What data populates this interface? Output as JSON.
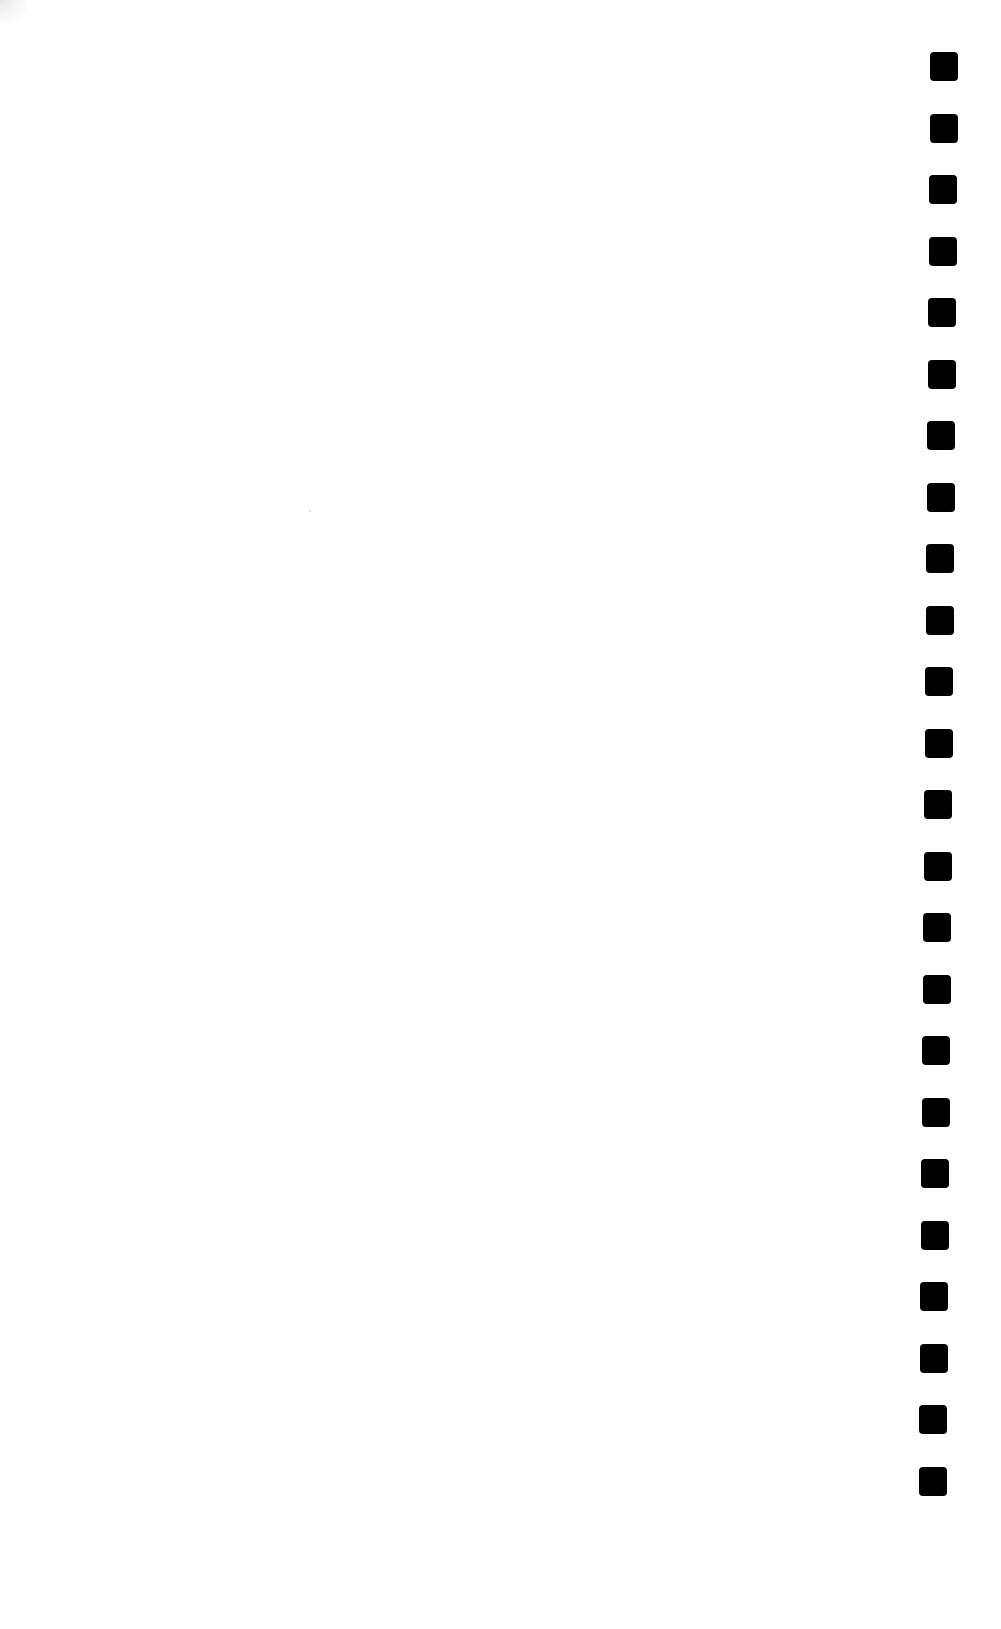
{
  "document": {
    "type": "scanned-blank-page",
    "background_color": "#fefefe",
    "text_content": "",
    "binding_holes": {
      "count": 24,
      "color": "#000000",
      "shape": "rounded-square",
      "size_px": 28,
      "side": "right",
      "positions": [
        {
          "x": 944,
          "y": 66
        },
        {
          "x": 944,
          "y": 128
        },
        {
          "x": 943,
          "y": 189
        },
        {
          "x": 943,
          "y": 251
        },
        {
          "x": 942,
          "y": 312
        },
        {
          "x": 942,
          "y": 374
        },
        {
          "x": 941,
          "y": 435
        },
        {
          "x": 941,
          "y": 497
        },
        {
          "x": 940,
          "y": 558
        },
        {
          "x": 940,
          "y": 620
        },
        {
          "x": 939,
          "y": 681
        },
        {
          "x": 939,
          "y": 743
        },
        {
          "x": 938,
          "y": 804
        },
        {
          "x": 938,
          "y": 866
        },
        {
          "x": 937,
          "y": 927
        },
        {
          "x": 937,
          "y": 989
        },
        {
          "x": 936,
          "y": 1050
        },
        {
          "x": 936,
          "y": 1112
        },
        {
          "x": 935,
          "y": 1173
        },
        {
          "x": 935,
          "y": 1235
        },
        {
          "x": 934,
          "y": 1296
        },
        {
          "x": 934,
          "y": 1358
        },
        {
          "x": 933,
          "y": 1419
        },
        {
          "x": 933,
          "y": 1481
        }
      ]
    }
  }
}
